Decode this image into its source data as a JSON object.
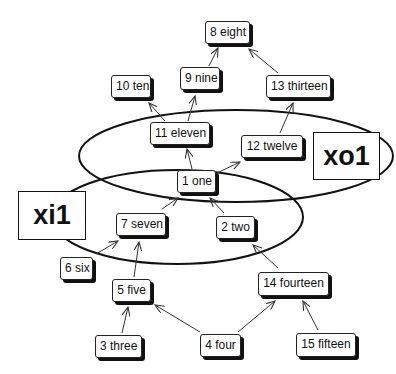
{
  "diagram": {
    "type": "directed-graph",
    "ports": [
      {
        "id": "xi1",
        "label": "xi1"
      },
      {
        "id": "xo1",
        "label": "xo1"
      }
    ],
    "groups": [
      {
        "id": "xo1-ellipse",
        "port": "xo1",
        "members": [
          "1",
          "11",
          "12"
        ]
      },
      {
        "id": "xi1-ellipse",
        "port": "xi1",
        "members": [
          "1",
          "7",
          "2"
        ]
      }
    ],
    "nodes": [
      {
        "id": "1",
        "label": "1 one"
      },
      {
        "id": "2",
        "label": "2 two"
      },
      {
        "id": "3",
        "label": "3 three"
      },
      {
        "id": "4",
        "label": "4 four"
      },
      {
        "id": "5",
        "label": "5 five"
      },
      {
        "id": "6",
        "label": "6 six"
      },
      {
        "id": "7",
        "label": "7 seven"
      },
      {
        "id": "8",
        "label": "8 eight"
      },
      {
        "id": "9",
        "label": "9 nine"
      },
      {
        "id": "10",
        "label": "10 ten"
      },
      {
        "id": "11",
        "label": "11 eleven"
      },
      {
        "id": "12",
        "label": "12 twelve"
      },
      {
        "id": "13",
        "label": "13 thirteen"
      },
      {
        "id": "14",
        "label": "14 fourteen"
      },
      {
        "id": "15",
        "label": "15 fifteen"
      }
    ],
    "edges": [
      {
        "from": "9",
        "to": "8"
      },
      {
        "from": "13",
        "to": "8"
      },
      {
        "from": "11",
        "to": "10"
      },
      {
        "from": "11",
        "to": "9"
      },
      {
        "from": "12",
        "to": "13"
      },
      {
        "from": "1",
        "to": "11"
      },
      {
        "from": "1",
        "to": "12"
      },
      {
        "from": "7",
        "to": "1"
      },
      {
        "from": "2",
        "to": "1"
      },
      {
        "from": "6",
        "to": "7"
      },
      {
        "from": "5",
        "to": "7"
      },
      {
        "from": "3",
        "to": "5"
      },
      {
        "from": "4",
        "to": "5"
      },
      {
        "from": "4",
        "to": "14"
      },
      {
        "from": "15",
        "to": "14"
      },
      {
        "from": "14",
        "to": "2"
      }
    ],
    "colors": {
      "line": "#111111",
      "arrow": "#333333",
      "box_fill": "#ffffff",
      "shadow": "#111111"
    }
  }
}
